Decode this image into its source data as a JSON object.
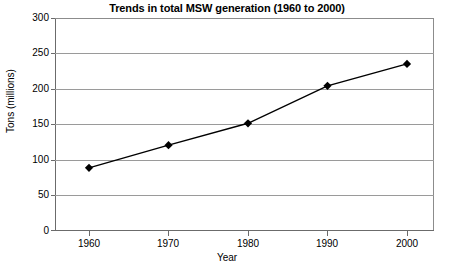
{
  "chart_data": {
    "type": "line",
    "title": "Trends in total MSW generation (1960 to 2000)",
    "xlabel": "Year",
    "ylabel": "Tons (millions)",
    "categories": [
      "1960",
      "1970",
      "1980",
      "1990",
      "2000"
    ],
    "x": [
      1960,
      1970,
      1980,
      1990,
      2000
    ],
    "values": [
      88,
      120,
      151,
      204,
      235
    ],
    "series": [
      {
        "name": "Total MSW generation",
        "values": [
          88,
          120,
          151,
          204,
          235
        ]
      }
    ],
    "ylim": [
      0,
      300
    ],
    "ytick_labels": [
      "0",
      "50",
      "100",
      "150",
      "200",
      "250",
      "300"
    ],
    "ytick_values": [
      0,
      50,
      100,
      150,
      200,
      250,
      300
    ],
    "xtick_labels": [
      "1960",
      "1970",
      "1980",
      "1990",
      "2000"
    ],
    "grid": "horizontal",
    "legend": "none",
    "marker": "diamond",
    "line_color": "#000000",
    "marker_color": "#000000",
    "grid_color": "#9a9a9a",
    "background_color": "#ffffff"
  }
}
